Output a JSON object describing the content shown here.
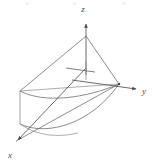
{
  "figure": {
    "kind": "3d-coordinate-diagram",
    "background_color": "#ffffff",
    "line_color": "#6e6e73",
    "axis_color": "#5a5a5f",
    "label_color": "#4a4a4a",
    "caption": "",
    "axes": [
      {
        "name": "x-axis",
        "label": "x",
        "direction": "down-left",
        "arrow": true
      },
      {
        "name": "y-axis",
        "label": "y",
        "direction": "right",
        "arrow": true
      },
      {
        "name": "z-axis",
        "label": "z",
        "direction": "up",
        "arrow": true
      }
    ],
    "labels": {
      "x": "x",
      "y": "y",
      "z": "z"
    },
    "geometry": {
      "origin": [
        72,
        75
      ],
      "z_apex": [
        86,
        36
      ],
      "z_arrow_tip": [
        86,
        21
      ],
      "x_arrow_tip": [
        14,
        144
      ],
      "y_arrow_tip": [
        140,
        89
      ],
      "y_surface_point": [
        119,
        84
      ],
      "left_top_corner": [
        20,
        91
      ],
      "left_bottom_corner": [
        20,
        124
      ],
      "surface_type": "parabolic-cone-region",
      "curves": [
        "upper-arc",
        "lower-arc",
        "left-vertical-edge",
        "ruling-apex-to-left-top",
        "ruling-apex-to-y-point",
        "ruling-y-point-to-x-tip",
        "ruling-y-point-to-left-top"
      ]
    }
  }
}
